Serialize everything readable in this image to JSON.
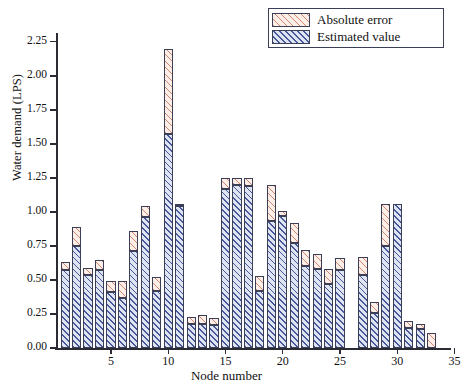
{
  "chart_data": {
    "type": "bar",
    "subtype": "stacked-bar",
    "title": "",
    "xlabel": "Node number",
    "ylabel": "Water demand (LPS)",
    "xlim": [
      0.2,
      34.6
    ],
    "ylim": [
      0.0,
      2.3
    ],
    "ytick_labels": [
      "0.00",
      "0.25",
      "0.50",
      "0.75",
      "1.00",
      "1.25",
      "1.50",
      "1.75",
      "2.00",
      "2.25"
    ],
    "ytick_values": [
      0.0,
      0.25,
      0.5,
      0.75,
      1.0,
      1.25,
      1.5,
      1.75,
      2.0,
      2.25
    ],
    "xtick_labels": [
      "5",
      "10",
      "15",
      "20",
      "25",
      "30",
      "35"
    ],
    "xtick_values": [
      5,
      10,
      15,
      20,
      25,
      30,
      35
    ],
    "grid": false,
    "legend_position": "top-right",
    "legend": [
      "Absolute error",
      "Estimated value"
    ],
    "series": [
      {
        "name": "Estimated value",
        "color": "#dfe4f3",
        "hatch_color": "#2c3e8a",
        "values": [
          0.57,
          0.75,
          0.54,
          0.57,
          0.41,
          0.37,
          0.71,
          0.96,
          0.42,
          1.57,
          1.04,
          0.18,
          0.18,
          0.17,
          1.17,
          1.2,
          1.19,
          0.42,
          0.93,
          0.97,
          0.77,
          0.6,
          0.58,
          0.47,
          0.57,
          0.0,
          0.54,
          0.26,
          0.75,
          1.06,
          0.15,
          0.14,
          0.0
        ]
      },
      {
        "name": "Absolute error",
        "color": "#fdeee8",
        "hatch_color": "#c46c56",
        "values": [
          0.06,
          0.14,
          0.05,
          0.08,
          0.08,
          0.12,
          0.15,
          0.08,
          0.1,
          0.63,
          0.02,
          0.05,
          0.06,
          0.05,
          0.08,
          0.05,
          0.06,
          0.11,
          0.27,
          0.04,
          0.15,
          0.12,
          0.11,
          0.11,
          0.09,
          0.0,
          0.13,
          0.08,
          0.31,
          0.0,
          0.05,
          0.04,
          0.11
        ]
      }
    ],
    "categories": [
      1,
      2,
      3,
      4,
      5,
      6,
      7,
      8,
      9,
      10,
      11,
      12,
      13,
      14,
      15,
      16,
      17,
      18,
      19,
      20,
      21,
      22,
      23,
      24,
      25,
      26,
      27,
      28,
      29,
      30,
      31,
      32,
      33
    ],
    "totals": [
      0.63,
      0.89,
      0.59,
      0.65,
      0.49,
      0.49,
      0.86,
      1.04,
      0.52,
      2.2,
      1.06,
      0.23,
      0.24,
      0.22,
      1.25,
      1.25,
      1.25,
      0.53,
      1.2,
      1.01,
      0.92,
      0.72,
      0.69,
      0.58,
      0.66,
      0.0,
      0.67,
      0.34,
      1.06,
      1.06,
      0.2,
      0.18,
      0.11
    ]
  },
  "axis": {
    "y_title": "Water demand (LPS)",
    "x_title": "Node number"
  },
  "legend": {
    "items": [
      {
        "label": "Absolute error",
        "swatch": "hatch-pink"
      },
      {
        "label": "Estimated value",
        "swatch": "hatch-blue"
      }
    ]
  }
}
